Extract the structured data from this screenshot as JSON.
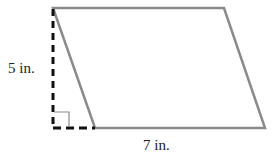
{
  "diagram": {
    "shape": "parallelogram",
    "height_label": "5 in.",
    "base_label": "7 in.",
    "colors": {
      "outline": "#8a8a8a",
      "dashed": "#111111",
      "text": "#222222"
    }
  }
}
